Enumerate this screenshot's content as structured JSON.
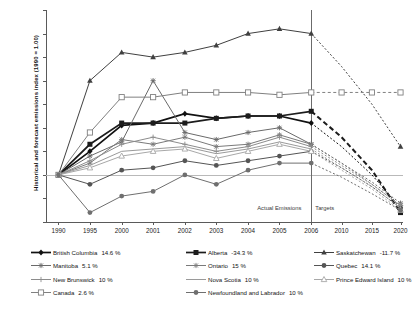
{
  "chart_data": {
    "type": "line",
    "title": "",
    "xlabel": "",
    "ylabel": "Historical and forecast emissions index (1990 = 1.00)",
    "ylim": [
      0.8,
      1.7
    ],
    "yticks": [
      "0.8",
      "0.9",
      "1",
      "1.1",
      "1.2",
      "1.3",
      "1.4",
      "1.5",
      "1.6",
      "1.7"
    ],
    "categories": [
      "1990",
      "1995",
      "2000",
      "2001",
      "2002",
      "2003",
      "2004",
      "2005",
      "2006",
      "2010",
      "2015",
      "2020"
    ],
    "grid": false,
    "reference_line": 1.0,
    "divider_category": "2006",
    "annotations": [
      {
        "text": "Actual Emissions",
        "x": "left-of-2006"
      },
      {
        "text": "Targets",
        "x": "right-of-2006"
      }
    ],
    "legend_position": "below",
    "forecast_start_index": 8,
    "series": [
      {
        "name": "British Columbia",
        "target": "14.6 %",
        "color": "#111111",
        "marker": "diamond",
        "values": [
          1.0,
          1.1,
          1.21,
          1.22,
          1.26,
          1.24,
          1.25,
          1.25,
          1.22,
          1.12,
          1.0,
          0.86
        ]
      },
      {
        "name": "Alberta",
        "target": "-34.3 %",
        "color": "#1c1c1c",
        "marker": "square",
        "values": [
          1.0,
          1.13,
          1.22,
          1.22,
          1.22,
          1.24,
          1.25,
          1.25,
          1.27,
          1.16,
          1.02,
          0.84
        ]
      },
      {
        "name": "Saskatchewan",
        "target": "-11.7 %",
        "color": "#404040",
        "marker": "triangle",
        "values": [
          1.0,
          1.4,
          1.52,
          1.5,
          1.52,
          1.55,
          1.6,
          1.62,
          1.6,
          1.46,
          1.3,
          1.12
        ]
      },
      {
        "name": "Manitoba",
        "target": "5.1 %",
        "color": "#6a6a6a",
        "marker": "cross",
        "values": [
          1.0,
          1.08,
          1.14,
          1.4,
          1.18,
          1.15,
          1.18,
          1.2,
          1.13,
          1.05,
          0.97,
          0.88
        ]
      },
      {
        "name": "Ontario",
        "target": "15 %",
        "color": "#7a7a7a",
        "marker": "star",
        "values": [
          1.0,
          1.05,
          1.15,
          1.13,
          1.16,
          1.12,
          1.13,
          1.17,
          1.13,
          1.05,
          0.96,
          0.87
        ]
      },
      {
        "name": "Quebec",
        "target": "14.1 %",
        "color": "#555555",
        "marker": "circle",
        "values": [
          1.0,
          0.96,
          1.02,
          1.03,
          1.06,
          1.04,
          1.06,
          1.08,
          1.1,
          1.03,
          0.95,
          0.86
        ]
      },
      {
        "name": "New Brunswick",
        "target": "10 %",
        "color": "#8c8c8c",
        "marker": "plus",
        "values": [
          1.0,
          1.06,
          1.13,
          1.16,
          1.13,
          1.1,
          1.12,
          1.16,
          1.12,
          1.04,
          0.96,
          0.87
        ]
      },
      {
        "name": "Nova Scotia",
        "target": "10 %",
        "color": "#9a9a9a",
        "marker": "none",
        "values": [
          1.0,
          1.04,
          1.1,
          1.11,
          1.12,
          1.09,
          1.11,
          1.14,
          1.11,
          1.03,
          0.95,
          0.86
        ]
      },
      {
        "name": "Prince Edward Island",
        "target": "10 %",
        "color": "#a8a8a8",
        "marker": "triangle-open",
        "values": [
          1.0,
          1.03,
          1.08,
          1.1,
          1.11,
          1.07,
          1.1,
          1.13,
          1.1,
          1.02,
          0.94,
          0.85
        ]
      },
      {
        "name": "Canada",
        "target": "2.6 %",
        "color": "#808080",
        "marker": "square-open",
        "values": [
          1.0,
          1.18,
          1.33,
          1.33,
          1.35,
          1.35,
          1.35,
          1.34,
          1.35,
          1.35,
          1.35,
          1.35
        ]
      },
      {
        "name": "Newfoundland and Labrador",
        "target": "10 %",
        "color": "#6f6f6f",
        "marker": "circle-dark",
        "values": [
          1.0,
          0.84,
          0.91,
          0.93,
          1.0,
          0.96,
          1.02,
          1.05,
          1.05,
          0.99,
          0.92,
          0.85
        ]
      }
    ]
  }
}
